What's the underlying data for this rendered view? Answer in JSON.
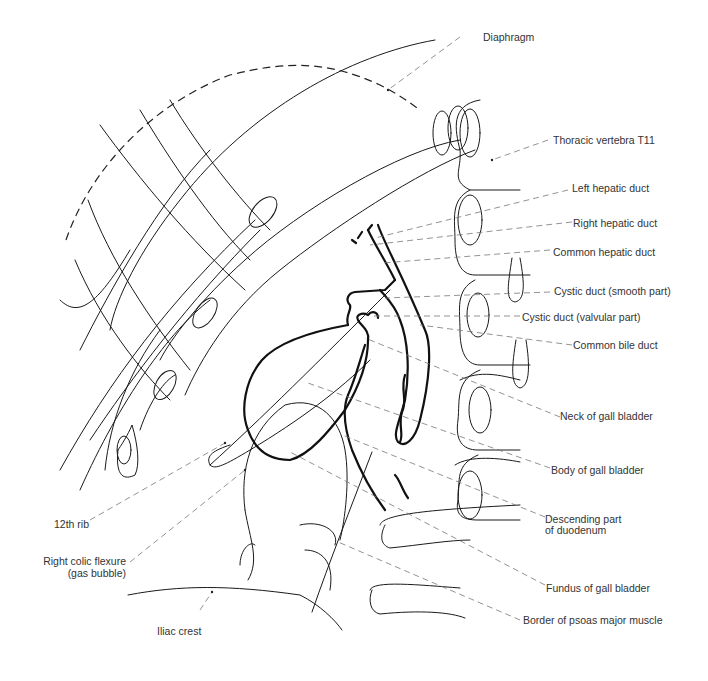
{
  "figure": {
    "labels": {
      "diaphragm": "Diaphragm",
      "thoracic_vertebra": "Thoracic vertebra T11",
      "left_hepatic_duct": "Left hepatic duct",
      "right_hepatic_duct": "Right hepatic duct",
      "common_hepatic_duct": "Common hepatic duct",
      "cystic_duct_smooth": "Cystic duct (smooth part)",
      "cystic_duct_valvular": "Cystic duct (valvular part)",
      "common_bile_duct": "Common bile duct",
      "neck_gall_bladder": "Neck of gall bladder",
      "body_gall_bladder": "Body of gall bladder",
      "descending_duodenum_line1": "Descending part",
      "descending_duodenum_line2": "of duodenum",
      "fundus_gall_bladder": "Fundus of gall bladder",
      "psoas_border": "Border of psoas major muscle",
      "rib_12": "12th rib",
      "right_colic_line1": "Right colic flexure",
      "right_colic_line2": "(gas bubble)",
      "iliac_crest": "Iliac crest"
    }
  }
}
